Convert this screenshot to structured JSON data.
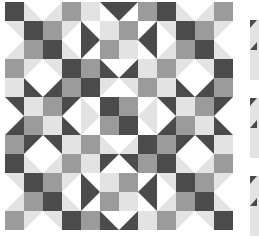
{
  "palette": {
    "D": "#4b4b4b",
    "M": "#9b9b9b",
    "L": "#e3e3e3",
    "W": "#ffffff"
  },
  "quilt": {
    "rows": [
      [
        "D",
        "L/W:bl",
        "L/W:br",
        "M",
        "L",
        "D/W:tr",
        "D/W:tl",
        "M",
        "D",
        "L/W:bl",
        "L/W:br",
        "M"
      ],
      [
        "L/W:tr",
        "D",
        "M",
        "L/W:tl",
        "D/W:bl",
        "L",
        "M",
        "D/W:br",
        "L/W:tr",
        "D",
        "M",
        "L/W:tl"
      ],
      [
        "L/W:br",
        "M",
        "D",
        "L/W:bl",
        "D/W:tl",
        "M",
        "L",
        "D/W:tr",
        "L/W:br",
        "M",
        "D",
        "L/W:bl"
      ],
      [
        "M",
        "L/W:tl",
        "L/W:tr",
        "D",
        "M",
        "D/W:bl",
        "D/W:br",
        "L",
        "M",
        "L/W:tl",
        "L/W:tr",
        "D"
      ],
      [
        "L",
        "D/W:bl",
        "D/W:br",
        "M",
        "D",
        "L/W:tl",
        "L/W:tr",
        "M",
        "L",
        "D/W:bl",
        "D/W:br",
        "M"
      ],
      [
        "D/W:tr",
        "L",
        "M",
        "D/W:tl",
        "L/W:bl",
        "D",
        "M",
        "L/W:br",
        "D/W:tr",
        "L",
        "M",
        "D/W:tl"
      ],
      [
        "D/W:br",
        "M",
        "L",
        "D/W:bl",
        "L/W:tl",
        "M",
        "D",
        "L/W:tr",
        "D/W:br",
        "M",
        "L",
        "D/W:bl"
      ],
      [
        "M",
        "D/W:tl",
        "D/W:tr",
        "L",
        "M",
        "L/W:bl",
        "L/W:br",
        "D",
        "M",
        "D/W:tl",
        "D/W:tr",
        "L"
      ],
      [
        "D",
        "L/W:bl",
        "L/W:br",
        "M",
        "L",
        "D/W:tl",
        "D/W:tr",
        "M",
        "D",
        "L/W:bl",
        "L/W:br",
        "M"
      ],
      [
        "L/W:tr",
        "D",
        "M",
        "L/W:tl",
        "D/W:bl",
        "L",
        "M",
        "D/W:br",
        "L/W:tr",
        "D",
        "M",
        "L/W:tl"
      ],
      [
        "L/W:br",
        "M",
        "D",
        "L/W:bl",
        "D/W:tl",
        "M",
        "L",
        "D/W:tr",
        "L/W:br",
        "M",
        "D",
        "L/W:bl"
      ],
      [
        "M",
        "L/W:tl",
        "L/W:tr",
        "D",
        "M",
        "D/W:bl",
        "D/W:br",
        "L",
        "M",
        "L/W:tl",
        "L/W:tr",
        "D"
      ]
    ]
  },
  "side_panel": {
    "tiles": [
      "tile-1",
      "tile-2",
      "tile-3"
    ]
  }
}
